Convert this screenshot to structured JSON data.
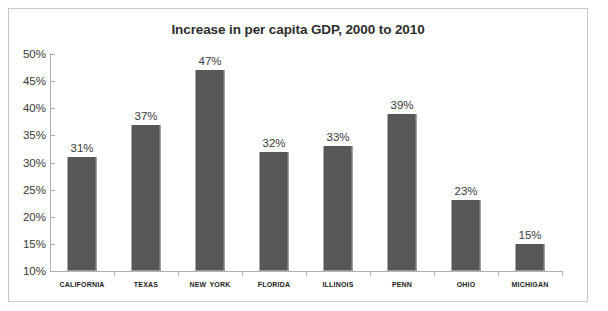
{
  "chart_data": {
    "type": "bar",
    "title": "Increase in per capita GDP, 2000 to 2010",
    "xlabel": "",
    "ylabel": "",
    "ylim": [
      10,
      50
    ],
    "ytick_step": 5,
    "ytick_labels": [
      "50%",
      "45%",
      "40%",
      "35%",
      "30%",
      "25%",
      "20%",
      "15%",
      "10%"
    ],
    "ytick_values": [
      50,
      45,
      40,
      35,
      30,
      25,
      20,
      15,
      10
    ],
    "grid": false,
    "legend": false,
    "categories": [
      "California",
      "Texas",
      "New York",
      "Florida",
      "Illinois",
      "Penn",
      "Ohio",
      "Michigan"
    ],
    "values": [
      31,
      37,
      47,
      32,
      33,
      39,
      23,
      15
    ],
    "value_labels": [
      "31%",
      "37%",
      "47%",
      "32%",
      "33%",
      "39%",
      "23%",
      "15%"
    ],
    "colors": {
      "bar_fill": "#575757",
      "bar_edge": "#9a9a9a",
      "axis": "#b0b0b0",
      "frame": "#c9c9c9",
      "text": "#3a3a3a",
      "title_text": "#2e2e2e",
      "category_text": "#1d1d1d",
      "background": "#ffffff"
    }
  }
}
